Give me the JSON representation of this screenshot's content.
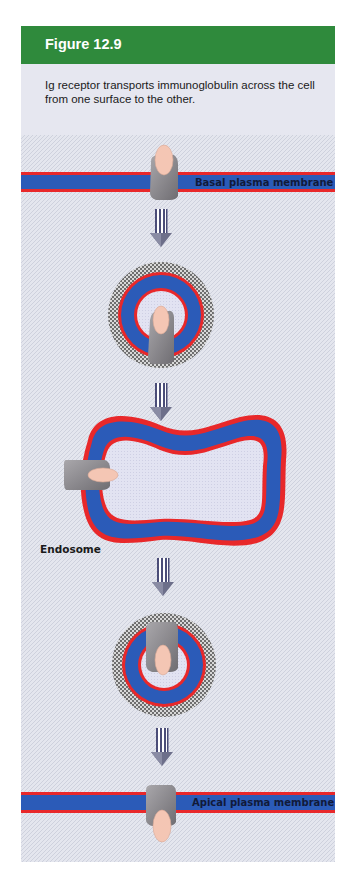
{
  "figure": {
    "title": "Figure 12.9",
    "caption": "Ig receptor transports immunoglobulin across the cell from one surface to the other."
  },
  "labels": {
    "basal_membrane": "Basal plasma membrane",
    "endosome": "Endosome",
    "apical_membrane": "Apical plasma membrane"
  },
  "colors": {
    "header_green": "#2f8a3c",
    "panel_bg": "#e6e7f0",
    "membrane_blue": "#2b5bb8",
    "membrane_red": "#e8282a",
    "receptor_gray": "#8c8a8e",
    "immunoglobulin_pink": "#f4c6b4",
    "coat_checker": "#7a7a7a"
  },
  "steps": [
    {
      "name": "basal-membrane-receptor",
      "order": 1
    },
    {
      "name": "transport-vesicle-1",
      "order": 2
    },
    {
      "name": "endosome",
      "order": 3
    },
    {
      "name": "transport-vesicle-2",
      "order": 4
    },
    {
      "name": "apical-membrane-release",
      "order": 5
    }
  ]
}
